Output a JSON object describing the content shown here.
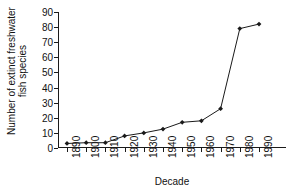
{
  "chart_data": {
    "type": "line",
    "title": "",
    "xlabel": "Decade",
    "ylabel": "Number of extinct freshwater fish species",
    "ylabel_line1": "Number of extinct freshwater",
    "ylabel_line2": "fish species",
    "categories": [
      "1890",
      "1900",
      "1910",
      "1920",
      "1930",
      "1940",
      "1950",
      "1960",
      "1970",
      "1980",
      "1990"
    ],
    "values": [
      3,
      3.5,
      3.5,
      8,
      10,
      12.5,
      17,
      18,
      26,
      79,
      82
    ],
    "ylim": [
      0,
      90
    ],
    "ytick_labels": [
      "0",
      "10",
      "20",
      "30",
      "40",
      "50",
      "60",
      "70",
      "80",
      "90"
    ],
    "ytick_values": [
      0,
      10,
      20,
      30,
      40,
      50,
      60,
      70,
      80,
      90
    ],
    "grid": false,
    "legend": "none",
    "marker": "diamond",
    "line_color": "#1a1a1a",
    "marker_color": "#1a1a1a",
    "background": "#ffffff"
  }
}
